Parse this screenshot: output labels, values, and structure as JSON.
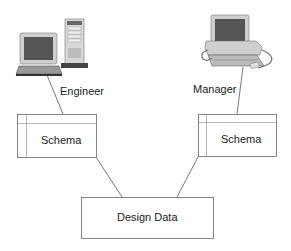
{
  "nodes": {
    "engineer": {
      "label": "Engineer",
      "icon": "desktop-tower-computer-icon"
    },
    "manager": {
      "label": "Manager",
      "icon": "desktop-workstation-computer-icon"
    },
    "schema_left": {
      "label": "Schema"
    },
    "schema_right": {
      "label": "Schema"
    },
    "design_data": {
      "label": "Design Data"
    }
  },
  "edges": [
    {
      "from": "engineer",
      "to": "schema_left"
    },
    {
      "from": "manager",
      "to": "schema_right"
    },
    {
      "from": "schema_left",
      "to": "design_data"
    },
    {
      "from": "schema_right",
      "to": "design_data"
    }
  ],
  "colors": {
    "line": "#555555",
    "box_border": "#666666",
    "text": "#222222"
  }
}
